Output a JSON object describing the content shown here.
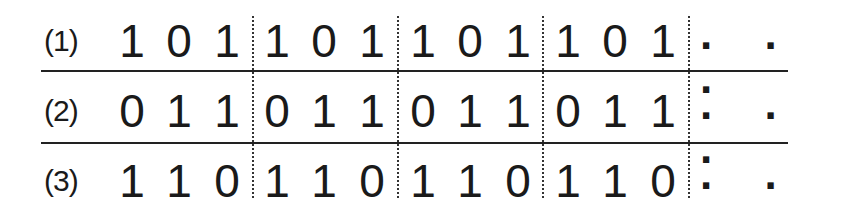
{
  "rows": [
    {
      "label": "(1)",
      "digits": [
        "1",
        "0",
        "1",
        "1",
        "0",
        "1",
        "1",
        "0",
        "1",
        "1",
        "0",
        "1"
      ],
      "ellipsis": ". . ."
    },
    {
      "label": "(2)",
      "digits": [
        "0",
        "1",
        "1",
        "0",
        "1",
        "1",
        "0",
        "1",
        "1",
        "0",
        "1",
        "1"
      ],
      "ellipsis": ". . ."
    },
    {
      "label": "(3)",
      "digits": [
        "1",
        "1",
        "0",
        "1",
        "1",
        "0",
        "1",
        "1",
        "0",
        "1",
        "1",
        "0"
      ],
      "ellipsis": ". . ."
    }
  ]
}
